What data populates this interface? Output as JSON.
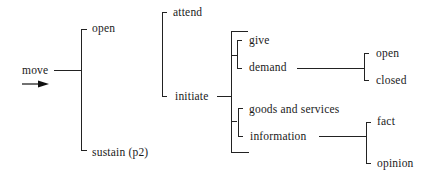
{
  "diagram": {
    "type": "system-network",
    "root": {
      "label": "move",
      "entry_arrow": "right-arrow"
    },
    "nodes": {
      "move": "move",
      "open": "open",
      "sustain": "sustain (p2)",
      "attend": "attend",
      "initiate": "initiate",
      "give": "give",
      "demand": "demand",
      "goods_services": "goods and services",
      "information": "information",
      "demand_open": "open",
      "demand_closed": "closed",
      "info_fact": "fact",
      "info_opinion": "opinion"
    },
    "edges": [
      {
        "from": "move",
        "to": [
          "open",
          "sustain (p2)"
        ],
        "kind": "or-system"
      },
      {
        "from": "open",
        "to": [
          "attend",
          "initiate"
        ],
        "kind": "or-system"
      },
      {
        "from": "initiate",
        "to": [
          [
            "give",
            "demand"
          ],
          [
            "goods and services",
            "information"
          ]
        ],
        "kind": "and-system"
      },
      {
        "from": "demand",
        "to": [
          "open",
          "closed"
        ],
        "kind": "or-system"
      },
      {
        "from": "information",
        "to": [
          "fact",
          "opinion"
        ],
        "kind": "or-system"
      }
    ]
  }
}
